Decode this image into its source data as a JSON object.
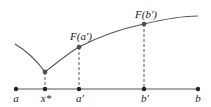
{
  "diagram": {
    "axis_points": [
      {
        "id": "a",
        "label": "a",
        "x": 16
      },
      {
        "id": "x-star",
        "label": "x*",
        "x": 45
      },
      {
        "id": "a-prime",
        "label": "a′",
        "x": 79
      },
      {
        "id": "b-prime",
        "label": "b′",
        "x": 144
      },
      {
        "id": "b",
        "label": "b",
        "x": 198
      }
    ],
    "curve_points": [
      {
        "id": "f-x-star",
        "label": "",
        "x": 45,
        "y": 72
      },
      {
        "id": "f-a-prime",
        "label": "F(a′)",
        "x": 79,
        "y": 47
      },
      {
        "id": "f-b-prime",
        "label": "F(b′)",
        "x": 144,
        "y": 24
      }
    ],
    "colors": {
      "line": "#444444",
      "point": "#222222"
    }
  }
}
